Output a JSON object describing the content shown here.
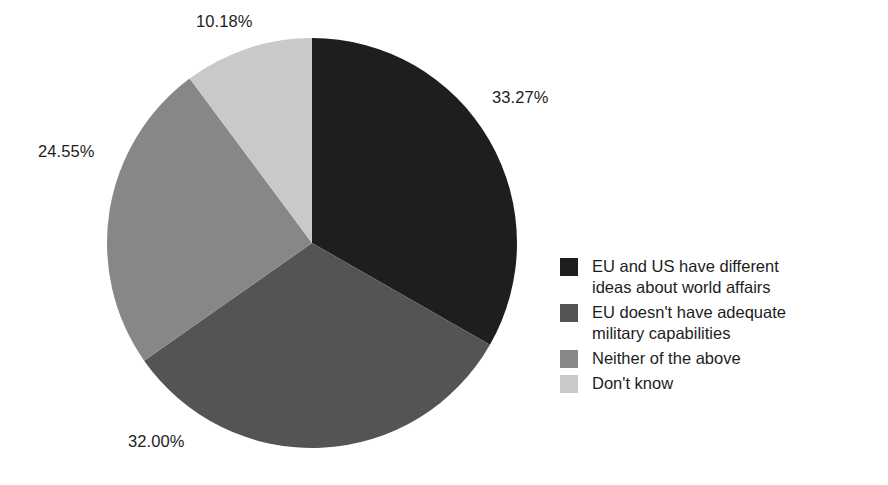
{
  "chart_data": {
    "type": "pie",
    "title": "",
    "subtitle": "",
    "xlabel": "",
    "ylabel": "",
    "grid": false,
    "legend_position": "right",
    "start_angle_deg": 0,
    "direction": "clockwise",
    "units": "percent",
    "categories": [
      "EU and US have different ideas about world affairs",
      "EU doesn't have adequate military capabilities",
      "Neither of the above",
      "Don't know"
    ],
    "values": [
      33.27,
      32.0,
      24.55,
      10.18
    ],
    "data_labels": [
      "33.27%",
      "32.00%",
      "24.55%",
      "10.18%"
    ],
    "colors": [
      "#1e1e1e",
      "#545454",
      "#878787",
      "#c9c9c9"
    ],
    "total": 100.0
  },
  "legend": {
    "items": [
      {
        "label": "EU and US have different\nideas about world affairs",
        "color": "#1e1e1e",
        "value_label": "33.27%"
      },
      {
        "label": "EU doesn't have adequate\nmilitary capabilities",
        "color": "#545454",
        "value_label": "32.00%"
      },
      {
        "label": "Neither of the above",
        "color": "#878787",
        "value_label": "24.55%"
      },
      {
        "label": "Don't know",
        "color": "#c9c9c9",
        "value_label": "10.18%"
      }
    ]
  },
  "labels": {
    "slice_0": "33.27%",
    "slice_1": "32.00%",
    "slice_2": "24.55%",
    "slice_3": "10.18%"
  },
  "geometry": {
    "center_x": 312,
    "center_y": 243,
    "radius": 205
  }
}
